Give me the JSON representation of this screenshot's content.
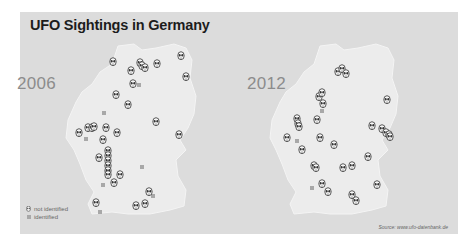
{
  "title": "UFO Sightings in Germany",
  "source": "Source: www.ufo-datenbank.de",
  "legend": {
    "not_identified": "not identified",
    "identified": "identified"
  },
  "colors": {
    "panel_bg": "#dcdcdc",
    "map_fill": "#ececec",
    "marker_stroke": "#333333",
    "identified": "#a8a8a8",
    "year_label": "#8c8c8c"
  },
  "chart_data": {
    "type": "scatter",
    "title": "UFO Sightings in Germany",
    "note": "Two side-by-side maps of Germany; points are approximate pixel positions on the screenshot",
    "legend": [
      "not identified",
      "identified"
    ],
    "maps": [
      {
        "year": "2006",
        "not_identified": [
          [
            113,
            62
          ],
          [
            140,
            63
          ],
          [
            142,
            66
          ],
          [
            145,
            68
          ],
          [
            157,
            64
          ],
          [
            181,
            56
          ],
          [
            131,
            71
          ],
          [
            133,
            84
          ],
          [
            186,
            77
          ],
          [
            116,
            95
          ],
          [
            128,
            105
          ],
          [
            156,
            122
          ],
          [
            179,
            135
          ],
          [
            79,
            133
          ],
          [
            88,
            128
          ],
          [
            92,
            128
          ],
          [
            94,
            127
          ],
          [
            106,
            128
          ],
          [
            117,
            133
          ],
          [
            103,
            140
          ],
          [
            99,
            158
          ],
          [
            108,
            151
          ],
          [
            108,
            156
          ],
          [
            108,
            161
          ],
          [
            108,
            166
          ],
          [
            108,
            171
          ],
          [
            108,
            175
          ],
          [
            120,
            175
          ],
          [
            114,
            183
          ],
          [
            149,
            192
          ],
          [
            96,
            203
          ],
          [
            136,
            206
          ],
          [
            145,
            204
          ]
        ],
        "identified": [
          [
            139,
            85
          ],
          [
            104,
            113
          ],
          [
            86,
            139
          ],
          [
            142,
            167
          ],
          [
            103,
            185
          ],
          [
            153,
            196
          ],
          [
            100,
            212
          ]
        ]
      },
      {
        "year": "2012",
        "not_identified": [
          [
            338,
            72
          ],
          [
            342,
            69
          ],
          [
            346,
            74
          ],
          [
            319,
            97
          ],
          [
            322,
            93
          ],
          [
            323,
            104
          ],
          [
            387,
            100
          ],
          [
            297,
            119
          ],
          [
            298,
            124
          ],
          [
            299,
            127
          ],
          [
            317,
            120
          ],
          [
            372,
            126
          ],
          [
            382,
            129
          ],
          [
            386,
            133
          ],
          [
            389,
            135
          ],
          [
            390,
            137
          ],
          [
            287,
            138
          ],
          [
            320,
            138
          ],
          [
            334,
            145
          ],
          [
            302,
            150
          ],
          [
            368,
            157
          ],
          [
            314,
            166
          ],
          [
            316,
            168
          ],
          [
            343,
            168
          ],
          [
            352,
            166
          ],
          [
            377,
            185
          ],
          [
            322,
            184
          ],
          [
            328,
            192
          ],
          [
            352,
            195
          ],
          [
            356,
            201
          ]
        ],
        "identified": [
          [
            322,
            111
          ],
          [
            297,
            141
          ],
          [
            312,
            188
          ]
        ]
      }
    ]
  }
}
